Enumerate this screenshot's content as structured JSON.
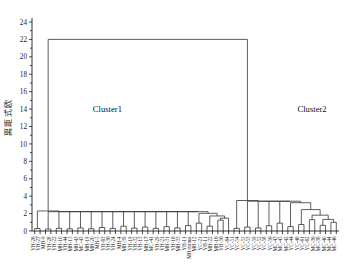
{
  "chart_data": {
    "type": "line",
    "subtype": "dendrogram",
    "title": "",
    "xlabel": "",
    "ylabel": "欧式距离",
    "ylim": [
      0,
      24
    ],
    "yticks": [
      0,
      2,
      4,
      6,
      8,
      10,
      12,
      14,
      16,
      18,
      20,
      22,
      24
    ],
    "ytick_labels": [
      "0",
      "2",
      "4",
      "6",
      "8",
      "10",
      "12",
      "14",
      "16",
      "18",
      "20",
      "22",
      "24"
    ],
    "grid": false,
    "legend_position": "none",
    "orientation": "top-down",
    "linkage_method": "average",
    "distance_metric": "euclidean",
    "root_height": 22,
    "annotations": [
      {
        "text": "Cluster1",
        "x_leaf": 13.5,
        "y": 14
      },
      {
        "text": "Cluster2",
        "x_leaf": 51.5,
        "y": 14
      }
    ],
    "leaf_labels": [
      "YH-26",
      "YH-27",
      "MH-9",
      "YH-28",
      "YH-22",
      "MH-10",
      "YH-44",
      "MH-15",
      "MH-43",
      "MC-43",
      "MH-19",
      "MH-20",
      "MH-5",
      "YH-63",
      "YH-36",
      "YH-24",
      "MH-4",
      "MH-39",
      "YH-19",
      "YH-32",
      "YH-13",
      "MH-17",
      "MC-41",
      "YH-29",
      "YH-21",
      "MH-31",
      "YH-18",
      "MH-33",
      "YH-11",
      "MH-minus",
      "MH-12",
      "YC-21",
      "YH-11",
      "MH-22",
      "MH-16",
      "YH-56",
      "YC-64",
      "YC-51",
      "YC-54",
      "YC-55",
      "YC-53",
      "YC-59",
      "YC-52",
      "YC-58",
      "YC-56",
      "MC-43",
      "MC-45",
      "MC-42",
      "YC-44",
      "YC-48",
      "YC-61",
      "YC-62",
      "MC-36",
      "MC-38",
      "MC-40",
      "MC-44",
      "MC-46"
    ],
    "clusters": {
      "cluster1": {
        "label": "Cluster1",
        "leaf_range": [
          0,
          36
        ],
        "merge_height": 2.3,
        "color": "#2a2a2a"
      },
      "cluster2": {
        "label": "Cluster2",
        "leaf_range": [
          37,
          56
        ],
        "merge_height": 3.5,
        "color": "#2a2a2a"
      }
    },
    "merges": [
      {
        "left": 0,
        "right": 1,
        "height": 0.28
      },
      {
        "left": 2,
        "right": 3,
        "height": 0.22
      },
      {
        "left": 4,
        "right": 5,
        "height": 0.3
      },
      {
        "left": 6,
        "right": 7,
        "height": 0.25
      },
      {
        "left": 8,
        "right": 9,
        "height": 0.35
      },
      {
        "left": 10,
        "right": 11,
        "height": 0.26
      },
      {
        "left": 12,
        "right": 13,
        "height": 0.4
      },
      {
        "left": 14,
        "right": 15,
        "height": 0.3
      },
      {
        "left": 16,
        "right": 17,
        "height": 0.55
      },
      {
        "left": 18,
        "right": 19,
        "height": 0.33
      },
      {
        "left": 20,
        "right": 21,
        "height": 0.45
      },
      {
        "left": 22,
        "right": 23,
        "height": 0.3
      },
      {
        "left": 24,
        "right": 25,
        "height": 0.5
      },
      {
        "left": 26,
        "right": 27,
        "height": 0.35
      },
      {
        "left": 28,
        "right": 29,
        "height": 0.62
      },
      {
        "left": 30,
        "right": 31,
        "height": 0.9
      },
      {
        "left": 32,
        "right": 33,
        "height": 0.55
      },
      {
        "left": 34,
        "right": 35,
        "height": 1.25
      },
      {
        "left": 37,
        "right": 38,
        "height": 0.3
      },
      {
        "left": 39,
        "right": 40,
        "height": 0.45
      },
      {
        "left": 41,
        "right": 42,
        "height": 0.35
      },
      {
        "left": 43,
        "right": 44,
        "height": 0.6
      },
      {
        "left": 45,
        "right": 46,
        "height": 0.9
      },
      {
        "left": 47,
        "right": 48,
        "height": 0.5
      },
      {
        "left": 49,
        "right": 50,
        "height": 0.75
      },
      {
        "left": 51,
        "right": 52,
        "height": 1.3
      },
      {
        "left": 53,
        "right": 54,
        "height": 0.65
      },
      {
        "left": 55,
        "right": 56,
        "height": 1.0
      }
    ],
    "series": [
      {
        "name": "dendrogram-links",
        "values": []
      }
    ]
  },
  "axis": {
    "y_title": "欧式距离",
    "y_tick_labels": [
      "0",
      "2",
      "4",
      "6",
      "8",
      "10",
      "12",
      "14",
      "16",
      "18",
      "20",
      "22",
      "24"
    ]
  }
}
